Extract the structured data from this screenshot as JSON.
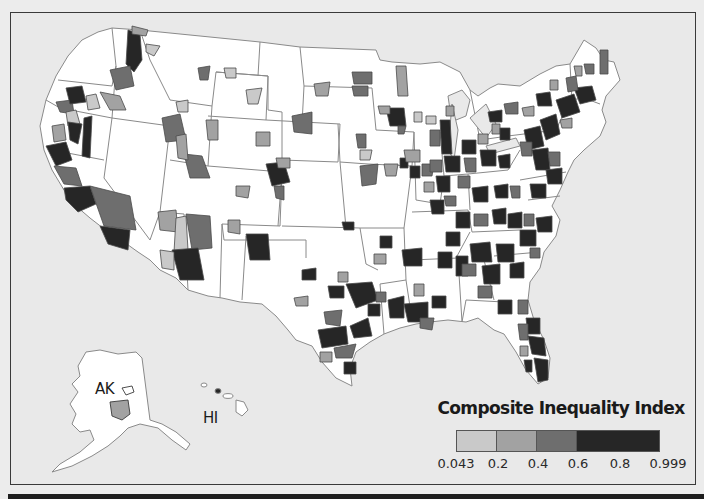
{
  "map": {
    "region": "United States",
    "inset_labels": {
      "alaska": "AK",
      "hawaii": "HI"
    },
    "colors": {
      "background": "#e9e9e9",
      "land": "#ffffff",
      "state_border": "#8a8a8a",
      "class_1": "#c9c9c9",
      "class_2": "#a2a2a2",
      "class_3": "#6e6e6e",
      "class_4": "#262626"
    }
  },
  "legend": {
    "title": "Composite Inequality Index",
    "classes": [
      {
        "from": "0.043",
        "to": "0.2",
        "color": "#c9c9c9"
      },
      {
        "from": "0.2",
        "to": "0.4",
        "color": "#a2a2a2"
      },
      {
        "from": "0.4",
        "to": "0.6",
        "color": "#6e6e6e"
      },
      {
        "from": "0.6",
        "to": "0.999",
        "color": "#262626"
      }
    ],
    "ticks": [
      "0.043",
      "0.2",
      "0.4",
      "0.6",
      "0.8",
      "0.999"
    ]
  }
}
